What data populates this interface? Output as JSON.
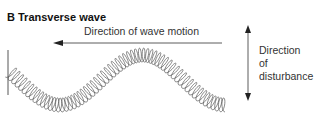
{
  "title": "B Transverse wave",
  "labels": {
    "wave_motion": "Direction of wave motion",
    "disturbance_line1": "Direction",
    "disturbance_line2": "of",
    "disturbance_line3": "disturbance"
  },
  "colors": {
    "ink": "#333333",
    "coil": "#555555"
  }
}
